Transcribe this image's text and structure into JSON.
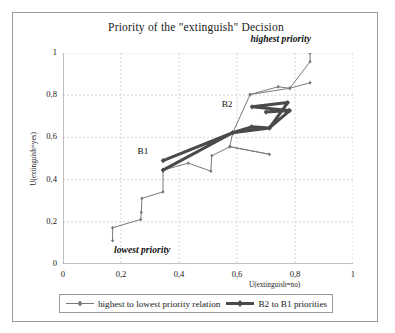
{
  "chart_data": {
    "type": "line",
    "title": "Priority of the \"extinguish\" Decision",
    "xlabel": "U(extinguish=no)",
    "ylabel": "U(extinguish=yes)",
    "xlim": [
      0,
      1
    ],
    "ylim": [
      0,
      1
    ],
    "xticks": [
      "0",
      "0,2",
      "0,4",
      "0,6",
      "0,8",
      "1"
    ],
    "xtick_values": [
      0,
      0.2,
      0.4,
      0.6,
      0.8,
      1
    ],
    "yticks": [
      "0",
      "0,2",
      "0,4",
      "0,6",
      "0,8",
      "1"
    ],
    "ytick_values": [
      0,
      0.2,
      0.4,
      0.6,
      0.8,
      1
    ],
    "grid": "dashed-both",
    "legend_position": "bottom",
    "series": [
      {
        "name": "highest to lowest priority relation",
        "style": "thin-line-with-diamond-markers",
        "color": "#7a7a7a",
        "line_width": 1,
        "marker": "diamond",
        "points": [
          [
            0.171,
            0.111
          ],
          [
            0.171,
            0.172
          ],
          [
            0.268,
            0.211
          ],
          [
            0.27,
            0.245
          ],
          [
            0.272,
            0.311
          ],
          [
            0.345,
            0.342
          ],
          [
            0.345,
            0.445
          ],
          [
            0.432,
            0.478
          ],
          [
            0.51,
            0.44
          ],
          [
            0.513,
            0.513
          ],
          [
            0.575,
            0.556
          ],
          [
            0.712,
            0.52
          ],
          [
            0.575,
            0.556
          ],
          [
            0.585,
            0.62
          ],
          [
            0.645,
            0.803
          ],
          [
            0.782,
            0.833
          ],
          [
            0.852,
            0.959
          ],
          [
            0.852,
            1.0
          ]
        ]
      },
      {
        "name": "B2 to B1 priorities",
        "style": "thick-line-with-diamond-markers",
        "color": "#4a4a4a",
        "line_width": 3,
        "marker": "diamond",
        "points": [
          [
            0.345,
            0.49
          ],
          [
            0.585,
            0.622
          ],
          [
            0.65,
            0.65
          ],
          [
            0.712,
            0.645
          ],
          [
            0.775,
            0.765
          ],
          [
            0.652,
            0.745
          ],
          [
            0.778,
            0.727
          ],
          [
            0.7,
            0.72
          ],
          [
            0.782,
            0.727
          ],
          [
            0.712,
            0.645
          ],
          [
            0.585,
            0.622
          ],
          [
            0.345,
            0.445
          ]
        ]
      },
      {
        "name": "B2 to B1 secondary",
        "style": "thin-line-with-diamond-markers",
        "color": "#7a7a7a",
        "line_width": 1,
        "marker": "diamond",
        "points": [
          [
            0.645,
            0.803
          ],
          [
            0.742,
            0.84
          ],
          [
            0.782,
            0.833
          ],
          [
            0.852,
            0.859
          ]
        ]
      }
    ],
    "annotations": [
      {
        "text": "highest priority",
        "x": 0.86,
        "y": 1.06,
        "style": "bold-italic"
      },
      {
        "text": "lowest priority",
        "x": 0.19,
        "y": 0.06,
        "style": "bold-italic"
      },
      {
        "text": "B1",
        "x": 0.295,
        "y": 0.525,
        "style": "plain"
      },
      {
        "text": "B2",
        "x": 0.585,
        "y": 0.748,
        "style": "plain"
      }
    ]
  },
  "legend": {
    "items": [
      {
        "label": "highest to lowest priority relation",
        "marker": "thin-diamond-line"
      },
      {
        "label": "B2 to B1 priorities",
        "marker": "thick-diamond-line"
      }
    ]
  }
}
